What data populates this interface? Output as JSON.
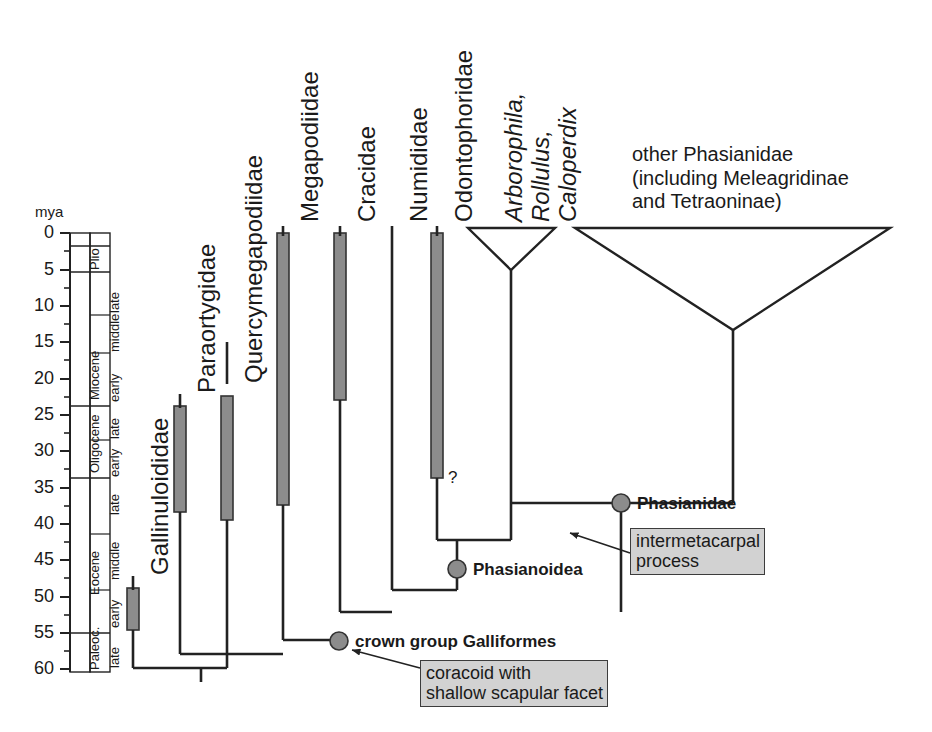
{
  "figure": {
    "type": "phylogenetic-tree-time-calibrated",
    "axis_label": "mya",
    "tick_values": [
      "0",
      "5",
      "10",
      "15",
      "20",
      "25",
      "30",
      "35",
      "40",
      "45",
      "50",
      "55",
      "60"
    ],
    "epochs": [
      {
        "name": "Plio",
        "from": 1.8,
        "to": 5.3
      },
      {
        "name": "Miocene",
        "from": 5.3,
        "to": 23.8
      },
      {
        "name": "Oligocene",
        "from": 23.8,
        "to": 33.7
      },
      {
        "name": "Eocene",
        "from": 33.7,
        "to": 55.0
      },
      {
        "name": "Paleoc.",
        "from": 55.0,
        "to": 61.5
      }
    ],
    "subepochs": [
      {
        "name": "late",
        "from": 5.3,
        "to": 11.2
      },
      {
        "name": "middle",
        "from": 11.2,
        "to": 16.4
      },
      {
        "name": "early",
        "from": 16.4,
        "to": 23.8
      },
      {
        "name": "late",
        "from": 23.8,
        "to": 28.5
      },
      {
        "name": "early",
        "from": 28.5,
        "to": 33.7
      },
      {
        "name": "late",
        "from": 33.7,
        "to": 41.3
      },
      {
        "name": "middle",
        "from": 41.3,
        "to": 49.0
      },
      {
        "name": "early",
        "from": 49.0,
        "to": 55.0
      },
      {
        "name": "late",
        "from": 55.0,
        "to": 61.5
      }
    ]
  },
  "taxa": [
    {
      "id": "gallinuloididae",
      "label": "Gallinuloididae",
      "italic": false
    },
    {
      "id": "paraortygidae",
      "label": "Paraortygidae",
      "italic": false
    },
    {
      "id": "quercymegapodiidae",
      "label": "Quercymegapodiidae",
      "italic": false
    },
    {
      "id": "megapodiidae",
      "label": "Megapodiidae",
      "italic": false
    },
    {
      "id": "cracidae",
      "label": "Cracidae",
      "italic": false
    },
    {
      "id": "numididae",
      "label": "Numididae",
      "italic": false
    },
    {
      "id": "odontophoridae",
      "label": "Odontophoridae",
      "italic": false
    },
    {
      "id": "arborophila-group",
      "label": "Arborophila,",
      "italic": true
    },
    {
      "id": "rollulus",
      "label": "Rollulus,",
      "italic": true
    },
    {
      "id": "caloperdix",
      "label": "Caloperdix",
      "italic": true
    }
  ],
  "clade_labels": {
    "other_phasianidae": "other Phasianidae\n(including Meleagridinae\nand Tetraoninae)"
  },
  "nodes": [
    {
      "id": "phasianidae",
      "label": "Phasianidae"
    },
    {
      "id": "phasianoidea",
      "label": "Phasianoidea"
    },
    {
      "id": "crown-galliformes",
      "label": "crown group Galliformes"
    }
  ],
  "character_boxes": [
    {
      "id": "intermetacarpal",
      "text": "intermetacarpal\nprocess"
    },
    {
      "id": "coracoid",
      "text": "coracoid with\nshallow scapular facet"
    }
  ],
  "uncertainty_marker": "?",
  "colors": {
    "range_bar_fill": "#8c8c8c",
    "range_bar_stroke": "#333333",
    "node_dot": "#8c8c8c",
    "line": "#222222",
    "box_fill": "#d2d2d2",
    "box_stroke": "#3c3c3c",
    "text": "#1a1a1a"
  }
}
